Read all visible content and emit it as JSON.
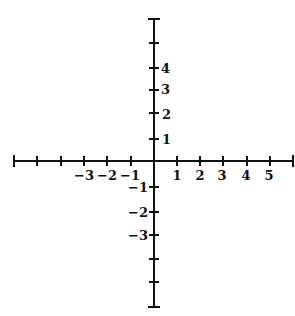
{
  "figure": {
    "origin_px": [
      154,
      161
    ],
    "unit_px_x": 23.3,
    "unit_px_y": 23.5,
    "line_color": "#111111",
    "background": "#ffffff"
  },
  "x_axis": {
    "range": [
      -6,
      6
    ],
    "tick_values": [
      -6,
      -5,
      -4,
      -3,
      -2,
      -1,
      1,
      2,
      3,
      4,
      5,
      6
    ],
    "labeled_ticks": [
      {
        "value": -3,
        "label": "−3"
      },
      {
        "value": -2,
        "label": "−2"
      },
      {
        "value": -1,
        "label": "−1"
      },
      {
        "value": 1,
        "label": "1"
      },
      {
        "value": 2,
        "label": "2"
      },
      {
        "value": 3,
        "label": "3"
      },
      {
        "value": 4,
        "label": "4"
      },
      {
        "value": 5,
        "label": "5"
      }
    ]
  },
  "y_axis": {
    "range": [
      -6,
      6
    ],
    "tick_values": [
      -6,
      -5,
      -4,
      -3,
      -2,
      -1,
      1,
      2,
      3,
      4,
      5,
      6
    ],
    "labeled_ticks": [
      {
        "value": 4,
        "label": "4"
      },
      {
        "value": 3,
        "label": "3"
      },
      {
        "value": 2,
        "label": "2"
      },
      {
        "value": 1,
        "label": "1"
      },
      {
        "value": -1,
        "label": "−1"
      },
      {
        "value": -2,
        "label": "−2"
      },
      {
        "value": -3,
        "label": "−3"
      }
    ]
  },
  "labels": {
    "x_neg3": "−3",
    "x_neg2": "−2",
    "x_neg1": "−1",
    "x_1": "1",
    "x_2": "2",
    "x_3": "3",
    "x_4": "4",
    "x_5": "5",
    "y_4": "4",
    "y_3": "3",
    "y_2": "2",
    "y_1": "1",
    "y_neg1": "−1",
    "y_neg2": "−2",
    "y_neg3": "−3"
  }
}
